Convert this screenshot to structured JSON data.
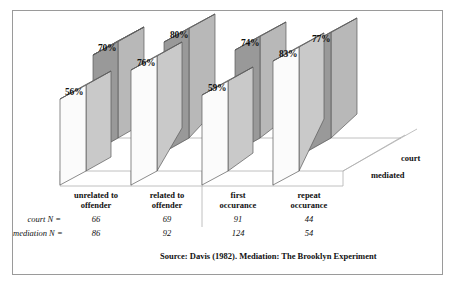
{
  "chart_data": {
    "type": "bar",
    "title": "",
    "subtitle": "",
    "xlabel": "",
    "ylabel": "",
    "ylim": [
      0,
      100
    ],
    "grid": false,
    "legend_position": "right-depth-axis",
    "categories": [
      "unrelated to offender",
      "related to offender",
      "first occurance",
      "repeat occurance"
    ],
    "series": [
      {
        "name": "court",
        "values": [
          70,
          80,
          74,
          77
        ],
        "color": "#999999",
        "value_labels": [
          "70%",
          "80%",
          "74%",
          "77%"
        ]
      },
      {
        "name": "mediated",
        "values": [
          56,
          76,
          59,
          83
        ],
        "color": "#f2f2f2",
        "value_labels": [
          "56%",
          "76%",
          "59%",
          "83%"
        ]
      }
    ],
    "annotations": {
      "source": "Source: Davis (1982). Mediation: The Brooklyn Experiment"
    },
    "table": {
      "row_labels": [
        "court N =",
        "mediation N ="
      ],
      "rows": [
        {
          "label": "court N =",
          "values": [
            "66",
            "69",
            "91",
            "44"
          ]
        },
        {
          "label": "mediation N =",
          "values": [
            "86",
            "92",
            "124",
            "54"
          ]
        }
      ]
    }
  },
  "legend": {
    "court": "court",
    "mediated": "mediated"
  },
  "colors": {
    "frame": "#9a9a9a",
    "axis": "#b0b0b0",
    "bar_court_front": "#999999",
    "bar_court_side": "#6e6e6e",
    "bar_court_top": "#b8b8b8",
    "bar_mediated_front": "#fbfbfb",
    "bar_mediated_side": "#c9c9c9",
    "bar_mediated_top": "#e8e8e8",
    "text": "#111111"
  }
}
